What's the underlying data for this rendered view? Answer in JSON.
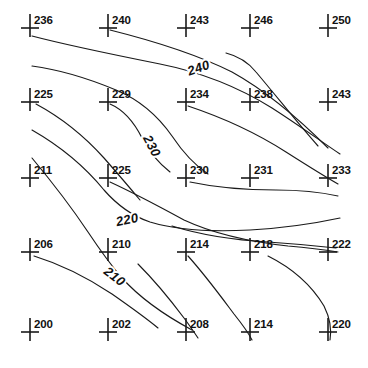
{
  "figure": {
    "name": "contour-map-of-spot-elevations",
    "width": 368,
    "height": 368,
    "background_color": "#ffffff",
    "ink_color": "#1a1a1a"
  },
  "spot_elevations": {
    "columns": 5,
    "rows": 5,
    "marker_icon": "plus-cross-icon",
    "x_positions": [
      30,
      108,
      186,
      250,
      328
    ],
    "y_positions": [
      28,
      102,
      178,
      252,
      332
    ],
    "grid": [
      [
        236,
        240,
        243,
        246,
        250
      ],
      [
        225,
        229,
        234,
        238,
        243
      ],
      [
        211,
        225,
        230,
        231,
        233
      ],
      [
        206,
        210,
        214,
        218,
        222
      ],
      [
        200,
        202,
        208,
        214,
        220
      ]
    ],
    "points": [
      {
        "label": "236",
        "x": 30,
        "y": 28
      },
      {
        "label": "240",
        "x": 108,
        "y": 28
      },
      {
        "label": "243",
        "x": 186,
        "y": 28
      },
      {
        "label": "246",
        "x": 250,
        "y": 28
      },
      {
        "label": "250",
        "x": 328,
        "y": 28
      },
      {
        "label": "225",
        "x": 30,
        "y": 102
      },
      {
        "label": "229",
        "x": 108,
        "y": 102
      },
      {
        "label": "234",
        "x": 186,
        "y": 102
      },
      {
        "label": "238",
        "x": 250,
        "y": 102
      },
      {
        "label": "243",
        "x": 328,
        "y": 102
      },
      {
        "label": "211",
        "x": 30,
        "y": 178
      },
      {
        "label": "225",
        "x": 108,
        "y": 178
      },
      {
        "label": "230",
        "x": 186,
        "y": 178
      },
      {
        "label": "231",
        "x": 250,
        "y": 178
      },
      {
        "label": "233",
        "x": 328,
        "y": 178
      },
      {
        "label": "206",
        "x": 30,
        "y": 252
      },
      {
        "label": "210",
        "x": 108,
        "y": 252
      },
      {
        "label": "214",
        "x": 186,
        "y": 252
      },
      {
        "label": "218",
        "x": 250,
        "y": 252
      },
      {
        "label": "222",
        "x": 328,
        "y": 252
      },
      {
        "label": "200",
        "x": 30,
        "y": 332
      },
      {
        "label": "202",
        "x": 108,
        "y": 332
      },
      {
        "label": "208",
        "x": 186,
        "y": 332
      },
      {
        "label": "214",
        "x": 250,
        "y": 332
      },
      {
        "label": "220",
        "x": 328,
        "y": 332
      }
    ]
  },
  "contours": {
    "interval": 10,
    "lines": [
      {
        "elevation": "240",
        "label": "240",
        "label_x": 200,
        "label_y": 72,
        "label_rotation": -19,
        "path": "M 32,36 C 70,46 120,56 160,64 C 200,72 240,88 272,108 C 300,126 322,142 340,154"
      },
      {
        "elevation": "240b",
        "label": "",
        "label_x": 0,
        "label_y": 0,
        "label_rotation": 0,
        "path": "M 110,30 C 150,40 196,54 232,72 C 268,92 300,120 328,148"
      },
      {
        "elevation": "240c",
        "label": "",
        "label_x": 0,
        "label_y": 0,
        "label_rotation": 0,
        "path": "M 226,53 C 238,56 248,62 256,72 C 278,98 300,126 318,146"
      },
      {
        "elevation": "230",
        "label": "230",
        "label_x": 148,
        "label_y": 148,
        "label_rotation": 62,
        "path": "M 32,66 C 62,70 92,80 116,90 C 140,100 158,116 172,136 C 184,154 196,166 208,174"
      },
      {
        "elevation": "230b",
        "label": "",
        "label_x": 0,
        "label_y": 0,
        "label_rotation": 0,
        "path": "M 110,104 C 124,110 134,122 142,138 C 150,154 160,164 170,172"
      },
      {
        "elevation": "230c",
        "label": "",
        "label_x": 0,
        "label_y": 0,
        "label_rotation": 0,
        "path": "M 36,104 C 62,118 86,138 104,158 C 118,174 130,188 140,200"
      },
      {
        "elevation": "234-line",
        "label": "",
        "label_x": 0,
        "label_y": 0,
        "label_rotation": 0,
        "path": "M 188,106 C 224,118 258,134 286,152 C 308,166 324,176 338,184"
      },
      {
        "elevation": "230-right",
        "label": "",
        "label_x": 0,
        "label_y": 0,
        "label_rotation": 0,
        "path": "M 190,182 C 218,188 248,190 276,190 C 302,190 320,192 338,196"
      },
      {
        "elevation": "220",
        "label": "220",
        "label_x": 128,
        "label_y": 224,
        "label_rotation": -12,
        "path": "M 32,130 C 60,146 86,168 104,190 C 118,206 132,216 150,222 C 176,230 212,232 250,230 C 286,228 312,224 340,218"
      },
      {
        "elevation": "220b",
        "label": "",
        "label_x": 0,
        "label_y": 0,
        "label_rotation": 0,
        "path": "M 110,182 C 136,194 162,208 184,220 C 214,234 252,242 288,246 C 312,248 326,250 338,252"
      },
      {
        "elevation": "220c",
        "label": "",
        "label_x": 0,
        "label_y": 0,
        "label_rotation": 0,
        "path": "M 172,226 C 198,234 232,240 268,242 C 298,244 318,246 336,248"
      },
      {
        "elevation": "210",
        "label": "210",
        "label_x": 112,
        "label_y": 280,
        "label_rotation": 38,
        "path": "M 32,158 C 52,182 72,208 88,232 C 100,250 110,264 122,278 C 140,298 166,316 192,330"
      },
      {
        "elevation": "210b",
        "label": "",
        "label_x": 0,
        "label_y": 0,
        "label_rotation": 0,
        "path": "M 34,256 C 60,264 88,278 112,294 C 132,308 146,318 158,328"
      },
      {
        "elevation": "210c",
        "label": "",
        "label_x": 0,
        "label_y": 0,
        "label_rotation": 0,
        "path": "M 138,264 C 156,282 172,302 184,318 C 190,326 194,332 198,338"
      },
      {
        "elevation": "214-spur",
        "label": "",
        "label_x": 0,
        "label_y": 0,
        "label_rotation": 0,
        "path": "M 188,256 C 206,276 222,298 234,314 C 242,324 248,332 252,340"
      },
      {
        "elevation": "218-spur",
        "label": "",
        "label_x": 0,
        "label_y": 0,
        "label_rotation": 0,
        "path": "M 268,256 C 292,268 312,286 324,306 C 330,318 332,328 330,340"
      }
    ]
  }
}
